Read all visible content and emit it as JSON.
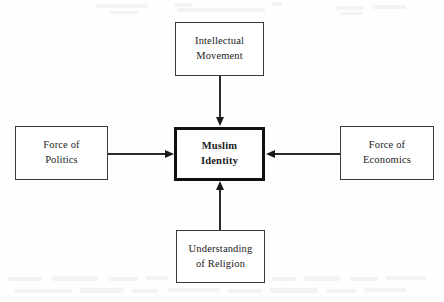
{
  "diagram": {
    "type": "central-convergence",
    "center": {
      "id": "muslim-identity",
      "label": "Muslim\nIdentity",
      "emphasis": "bold",
      "border_color": "#101010",
      "border_width_px": 3
    },
    "nodes": [
      {
        "id": "intellectual-movement",
        "label": "Intellectual\nMovement",
        "position": "top",
        "border_color": "#3a3a3a"
      },
      {
        "id": "force-of-politics",
        "label": "Force of\nPolitics",
        "position": "left",
        "border_color": "#3a3a3a"
      },
      {
        "id": "force-of-economics",
        "label": "Force of\nEconomics",
        "position": "right",
        "border_color": "#3a3a3a"
      },
      {
        "id": "understanding-of-religion",
        "label": "Understanding\nof Religion",
        "position": "bottom",
        "border_color": "#3a3a3a"
      }
    ],
    "connectors": [
      {
        "id": "arrow-top-to-center",
        "from": "intellectual-movement",
        "to": "muslim-identity",
        "direction": "down"
      },
      {
        "id": "arrow-left-to-center",
        "from": "force-of-politics",
        "to": "muslim-identity",
        "direction": "right"
      },
      {
        "id": "arrow-right-to-center",
        "from": "force-of-economics",
        "to": "muslim-identity",
        "direction": "left"
      },
      {
        "id": "arrow-bottom-to-center",
        "from": "understanding-of-religion",
        "to": "muslim-identity",
        "direction": "up"
      }
    ],
    "ink_color": "#1b1b1b",
    "background_color": "#fefefe"
  }
}
